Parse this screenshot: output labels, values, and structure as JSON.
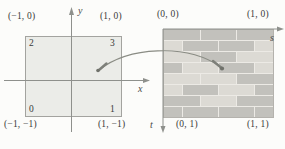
{
  "figure": {
    "background": "#fcfcfa"
  },
  "left_plot": {
    "axis_labels": {
      "x": "x",
      "y": "y"
    },
    "corner_labels": {
      "top_left": "(−1, 0)",
      "top_right": "(1, 0)",
      "bottom_left": "(−1, −1)",
      "bottom_right": "(1, −1)"
    },
    "vertex_numbers": {
      "top_left": "2",
      "top_right": "3",
      "bottom_left": "0",
      "bottom_right": "1"
    },
    "square_fill": "#ebece8",
    "square_border": "#a3a39f"
  },
  "right_plot": {
    "axis_labels": {
      "s": "s",
      "t": "t"
    },
    "corner_labels": {
      "top_left": "(0, 0)",
      "top_right": "(1, 0)",
      "bottom_left": "(0, 1)",
      "bottom_right": "(1, 1)"
    },
    "bricks": {
      "dark": "#c2c1bc",
      "light": "#dcdad4",
      "mortar": "#eceae5",
      "rows": [
        {
          "bricks": [
            [
              0.333,
              "dark"
            ],
            [
              0.333,
              "dark"
            ],
            [
              0.334,
              "dark"
            ]
          ]
        },
        {
          "bricks": [
            [
              0.167,
              "light"
            ],
            [
              0.333,
              "dark"
            ],
            [
              0.333,
              "dark"
            ],
            [
              0.167,
              "light"
            ]
          ]
        },
        {
          "bricks": [
            [
              0.333,
              "light"
            ],
            [
              0.333,
              "dark"
            ],
            [
              0.334,
              "light"
            ]
          ]
        },
        {
          "bricks": [
            [
              0.167,
              "dark"
            ],
            [
              0.333,
              "light"
            ],
            [
              0.333,
              "dark"
            ],
            [
              0.167,
              "light"
            ]
          ]
        },
        {
          "bricks": [
            [
              0.333,
              "light"
            ],
            [
              0.333,
              "light"
            ],
            [
              0.334,
              "dark"
            ]
          ]
        },
        {
          "bricks": [
            [
              0.167,
              "light"
            ],
            [
              0.333,
              "dark"
            ],
            [
              0.333,
              "light"
            ],
            [
              0.167,
              "dark"
            ]
          ]
        },
        {
          "bricks": [
            [
              0.333,
              "dark"
            ],
            [
              0.333,
              "light"
            ],
            [
              0.334,
              "dark"
            ]
          ]
        },
        {
          "bricks": [
            [
              0.167,
              "dark"
            ],
            [
              0.333,
              "dark"
            ],
            [
              0.333,
              "dark"
            ],
            [
              0.167,
              "dark"
            ]
          ]
        }
      ]
    }
  },
  "mapping": {
    "curve_color": "#8a8c84",
    "dot_color": "#70726b",
    "axis_color": "#8e908c"
  }
}
